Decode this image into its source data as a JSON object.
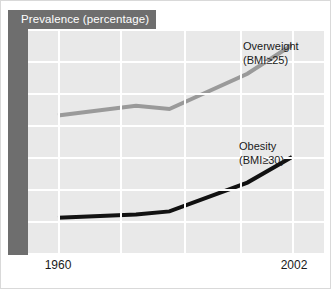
{
  "figure": {
    "title": "Prevalence (percentage)",
    "band_color": "#6e6e6e",
    "plot_background": "#e9e9e9",
    "grid_color": "#ffffff"
  },
  "chart_data": {
    "type": "line",
    "title": "Prevalence (percentage)",
    "xlabel": "",
    "ylabel": "Prevalence (percentage)",
    "xlim": [
      1960,
      2002
    ],
    "ylim": [
      0,
      70
    ],
    "yticks": [
      0,
      10,
      20,
      30,
      40,
      50,
      60,
      70
    ],
    "ytick_labels": [
      "0",
      "10",
      "20",
      "30",
      "40",
      "50",
      "60",
      "70"
    ],
    "xticks": [
      1960,
      2002
    ],
    "xtick_labels": [
      "1960",
      "2002"
    ],
    "grid": true,
    "legend_position": "inline-annotation",
    "x": [
      1960,
      1974,
      1980,
      1994,
      2002
    ],
    "series": [
      {
        "name": "Overweight (BMI≥25)",
        "label_line1": "Overweight",
        "label_line2": "(BMI≥25)",
        "color": "#9a9a9a",
        "values": [
          43,
          46,
          45,
          56,
          65
        ]
      },
      {
        "name": "Obesity (BMI≥30)",
        "label_line1": "Obesity",
        "label_line2": "(BMI≥30)",
        "color": "#111111",
        "values": [
          11,
          12,
          13,
          22,
          30
        ]
      }
    ]
  }
}
